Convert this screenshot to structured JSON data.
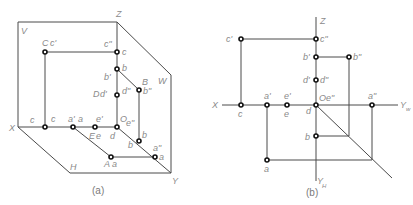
{
  "figure_a": {
    "caption": "(a)",
    "plane_labels": {
      "V": "V",
      "W": "W",
      "H": "H"
    },
    "axis_labels": {
      "X": "X",
      "Z": "Z",
      "Y": "Y"
    },
    "point_labels": {
      "C": "C",
      "c_prime": "c'",
      "c_dprime": "c\"",
      "c_z": "c",
      "c": "c",
      "c_x": "c",
      "b_prime": "b'",
      "b_z": "b",
      "B": "B",
      "b_dprime": "b\"",
      "D": "D",
      "d_prime": "d'",
      "d_dprime": "d\"",
      "a_prime": "a'",
      "a_x": "a",
      "e_prime": "e'",
      "O": "O",
      "e_dprime": "e\"",
      "E": "E",
      "e": "e",
      "d": "d",
      "b": "b",
      "b_y": "b",
      "a_dprime": "a\"",
      "a_y": "a",
      "A": "A",
      "a": "a"
    },
    "subscripts": {
      "z": "z",
      "x": "x",
      "y": "y"
    }
  },
  "figure_b": {
    "caption": "(b)",
    "axis_labels": {
      "X": "X",
      "Z": "Z",
      "Yw": "Y",
      "Yw_sub": "w",
      "Yh": "Y",
      "Yh_sub": "H"
    },
    "point_labels": {
      "c_prime": "c'",
      "c_dprime": "c\"",
      "b_prime": "b'",
      "b_dprime": "b\"",
      "d_prime": "d'",
      "d_dprime": "d\"",
      "a_prime": "a'",
      "e_prime": "e'",
      "O": "O",
      "e_dprime": "e\"",
      "a_dprime": "a\"",
      "c": "c",
      "e": "e",
      "d": "d",
      "b": "b",
      "a": "a"
    }
  }
}
